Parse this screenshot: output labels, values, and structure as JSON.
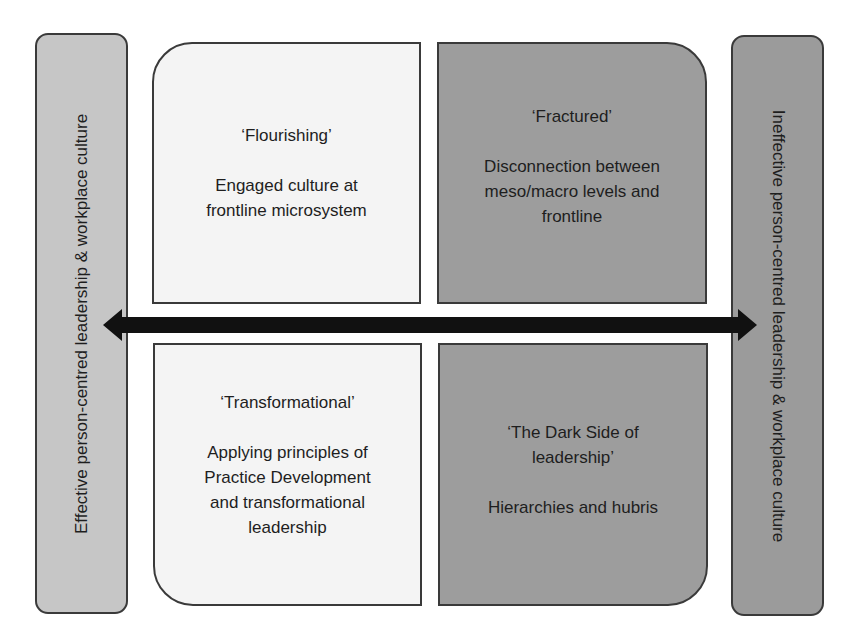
{
  "diagram": {
    "type": "2x2 matrix with bidirectional axis",
    "left_axis_label": "Effective person-centred leadership & workplace culture",
    "right_axis_label": "Ineffective person-centred leadership & workplace culture",
    "quadrants": {
      "top_left": {
        "title": "‘Flourishing’",
        "body": "Engaged culture at\nfrontline microsystem",
        "fill": "#f4f4f4"
      },
      "top_right": {
        "title": "‘Fractured’",
        "body": "Disconnection between\nmeso/macro levels and\nfrontline",
        "fill": "#9d9d9d"
      },
      "bottom_left": {
        "title": "‘Transformational’",
        "body": "Applying principles of\nPractice Development\nand transformational\nleadership",
        "fill": "#f4f4f4"
      },
      "bottom_right": {
        "title": "‘The Dark Side of\nleadership’",
        "body": "Hierarchies and hubris",
        "fill": "#9d9d9d"
      }
    },
    "arrow": {
      "direction": "bidirectional-horizontal",
      "color": "#111111"
    },
    "colors": {
      "left_bar": "#c6c6c6",
      "right_bar": "#9b9b9b",
      "border": "#3a3a3a"
    }
  }
}
